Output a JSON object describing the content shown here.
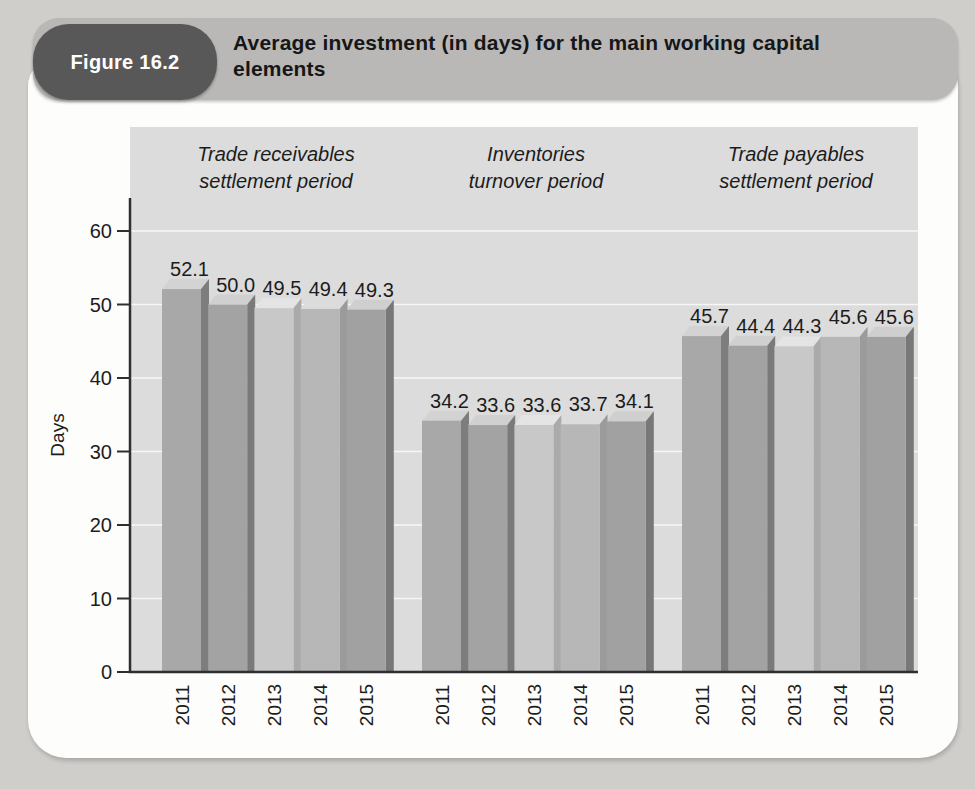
{
  "figure": {
    "tab_label": "Figure 16.2",
    "title_lines": [
      "Average investment (in days) for the main working capital",
      "elements"
    ]
  },
  "chart_data": {
    "type": "bar",
    "title": "Average investment (in days) for the main working capital elements",
    "ylabel": "Days",
    "ylim": [
      0,
      60
    ],
    "yticks": [
      0,
      10,
      20,
      30,
      40,
      50,
      60
    ],
    "grid": true,
    "legend_position": "none",
    "categories": [
      "2011",
      "2012",
      "2013",
      "2014",
      "2015"
    ],
    "groups": [
      {
        "label_lines": [
          "Trade receivables",
          "settlement period"
        ],
        "values": [
          52.1,
          50.0,
          49.5,
          49.4,
          49.3
        ]
      },
      {
        "label_lines": [
          "Inventories",
          "turnover period"
        ],
        "values": [
          34.2,
          33.6,
          33.6,
          33.7,
          34.1
        ]
      },
      {
        "label_lines": [
          "Trade payables",
          "settlement period"
        ],
        "values": [
          45.7,
          44.4,
          44.3,
          45.6,
          45.6
        ]
      }
    ],
    "bar_colors": {
      "2011": {
        "front": "#a8a8a8",
        "side": "#7d7d7d",
        "top": "#d3d3d3"
      },
      "2012": {
        "front": "#a3a3a3",
        "side": "#7a7a7a",
        "top": "#d0d0d0"
      },
      "2013": {
        "front": "#c8c8c8",
        "side": "#aaaaaa",
        "top": "#e4e4e4"
      },
      "2014": {
        "front": "#b7b7b7",
        "side": "#9b9b9b",
        "top": "#dcdcdc"
      },
      "2015": {
        "front": "#a1a1a1",
        "side": "#787878",
        "top": "#cfcfcf"
      }
    },
    "colors": {
      "plot_background": "#dcdcdc",
      "axis": "#2f2f2f",
      "gridline": "rgba(255,255,255,0.75)",
      "text": "#1c1c1c"
    }
  }
}
